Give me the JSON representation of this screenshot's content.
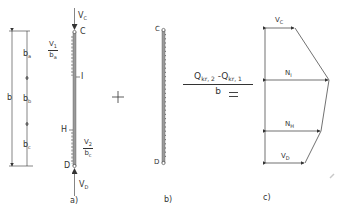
{
  "figure": {
    "panels": [
      {
        "id": "a",
        "caption": "a)",
        "dimensions": {
          "total": "b",
          "segments": [
            {
              "base": "b",
              "sub": "a"
            },
            {
              "base": "b",
              "sub": "b"
            },
            {
              "base": "b",
              "sub": "c"
            }
          ]
        },
        "points": {
          "top": "C",
          "upper": "I",
          "lower": "H",
          "bottom": "D"
        },
        "forces": {
          "top": {
            "base": "V",
            "sub": "C"
          },
          "bottom": {
            "base": "V",
            "sub": "D"
          }
        },
        "distributed_loads": [
          {
            "num_base": "V",
            "num_sub": "1",
            "den_base": "b",
            "den_sub": "a"
          },
          {
            "num_base": "V",
            "num_sub": "2",
            "den_base": "b",
            "den_sub": "c"
          }
        ]
      },
      {
        "id": "b",
        "caption": "b)",
        "points": {
          "top": "C",
          "bottom": "D"
        },
        "formula": {
          "num_a_base": "Q",
          "num_a_sub": "kr, 2",
          "op": "-",
          "num_b_base": "Q",
          "num_b_sub": "kr, 1",
          "den": "b"
        }
      },
      {
        "id": "c",
        "caption": "c)",
        "axial_force_labels": [
          {
            "base": "V",
            "sub": "C"
          },
          {
            "base": "N",
            "sub": "I"
          },
          {
            "base": "N",
            "sub": "H"
          },
          {
            "base": "V",
            "sub": "D"
          }
        ]
      }
    ],
    "operators": {
      "plus": "+"
    },
    "colors": {
      "line": "#333333",
      "column_fill": "#9a9a9a",
      "background": "#ffffff"
    }
  }
}
